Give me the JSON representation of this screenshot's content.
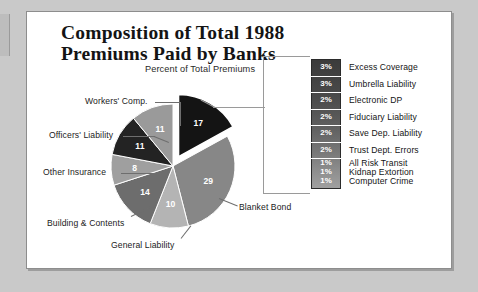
{
  "document": {
    "title": "Composition of Total 1988 Premiums Paid by Banks",
    "subtitle": "Percent of Total Premiums"
  },
  "colors": {
    "page_background": "#ffffff",
    "outer_background": "#c9c9c9",
    "frame_border": "#8d8d8d",
    "exploded_slice": "#141414",
    "leader_line": "#6e6e6e",
    "legend_strip_top": "#3b3b3b",
    "legend_strip_bottom": "#a0a0a0"
  },
  "chart_data": {
    "type": "pie",
    "title": "Composition of Total 1988 Premiums Paid by Banks",
    "subtitle": "Percent of Total Premiums",
    "unit": "percent",
    "value_suffix": "%",
    "legend_position": "right",
    "grid": false,
    "categories": [
      "Blanket Bond",
      "General Liability",
      "Building & Contents",
      "Other Insurance",
      "Officers' Liability",
      "Workers' Comp.",
      "Excess Coverage",
      "Umbrella Liability",
      "Electronic DP",
      "Fiduciary Liability",
      "Save Dep. Liability",
      "Trust Dept. Errors",
      "All Risk Transit",
      "Kidnap Extortion",
      "Computer Crime"
    ],
    "values": [
      29,
      10,
      14,
      8,
      11,
      11,
      3,
      3,
      2,
      2,
      2,
      2,
      1,
      1,
      1
    ],
    "slices": [
      {
        "label": "Blanket Bond",
        "value": 29,
        "display": "29",
        "color": "#878787",
        "labelled_on_pie": true,
        "exploded": false
      },
      {
        "label": "General Liability",
        "value": 10,
        "display": "10",
        "color": "#b4b4b4",
        "labelled_on_pie": true,
        "exploded": false
      },
      {
        "label": "Building & Contents",
        "value": 14,
        "display": "14",
        "color": "#6d6d6d",
        "labelled_on_pie": true,
        "exploded": false
      },
      {
        "label": "Other Insurance",
        "value": 8,
        "display": "8",
        "color": "#9f9f9f",
        "labelled_on_pie": true,
        "exploded": false
      },
      {
        "label": "Officers' Liability",
        "value": 11,
        "display": "11",
        "color": "#232323",
        "labelled_on_pie": true,
        "exploded": false
      },
      {
        "label": "Workers' Comp.",
        "value": 11,
        "display": "11",
        "color": "#9a9a9a",
        "labelled_on_pie": true,
        "exploded": false
      },
      {
        "label": "Grouped Coverages",
        "value": 17,
        "display": "17",
        "color": "#141414",
        "labelled_on_pie": true,
        "exploded": true
      }
    ],
    "pie_callout_labels": [
      "Workers' Comp.",
      "Officers' Liability",
      "Other Insurance",
      "Building & Contents",
      "General Liability",
      "Blanket Bond"
    ],
    "legend_entries": [
      {
        "percent": "3%",
        "label": "Excess Coverage",
        "value": 3
      },
      {
        "percent": "3%",
        "label": "Umbrella Liability",
        "value": 3
      },
      {
        "percent": "2%",
        "label": "Electronic DP",
        "value": 2
      },
      {
        "percent": "2%",
        "label": "Fiduciary Liability",
        "value": 2
      },
      {
        "percent": "2%",
        "label": "Save Dep. Liability",
        "value": 2
      },
      {
        "percent": "2%",
        "label": "Trust Dept. Errors",
        "value": 2
      },
      {
        "percent": "1%",
        "label": "All Risk Transit",
        "value": 1
      },
      {
        "percent": "1%",
        "label": "Kidnap Extortion",
        "value": 1
      },
      {
        "percent": "1%",
        "label": "Computer Crime",
        "value": 1
      }
    ]
  }
}
